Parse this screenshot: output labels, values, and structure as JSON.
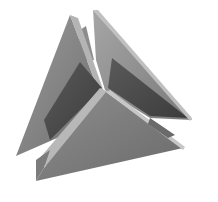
{
  "image": {
    "subject": "Grayscale 3D render of interlocking triangular plates forming a tetrahedral sculpture",
    "background": "#ffffff",
    "palette": {
      "light_face": "#a8a8a8",
      "mid_face": "#8a8a8a",
      "dark_face": "#4e4e4e",
      "edge_highlight": "#c4c4c4",
      "shadow": "#3a3a3a"
    }
  }
}
